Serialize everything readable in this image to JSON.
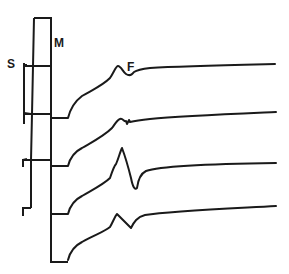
{
  "figure": {
    "labels": {
      "s": "S",
      "m": "M",
      "f": "F"
    },
    "colors": {
      "ink": "#1a1a1a",
      "background": "#ffffff"
    },
    "traces": [
      {
        "name": "trace-1",
        "feature": "F-wave small peak"
      },
      {
        "name": "trace-2",
        "feature": "small notch"
      },
      {
        "name": "trace-3",
        "feature": "large biphasic spike"
      },
      {
        "name": "trace-4",
        "feature": "moderate biphasic spike"
      }
    ]
  }
}
